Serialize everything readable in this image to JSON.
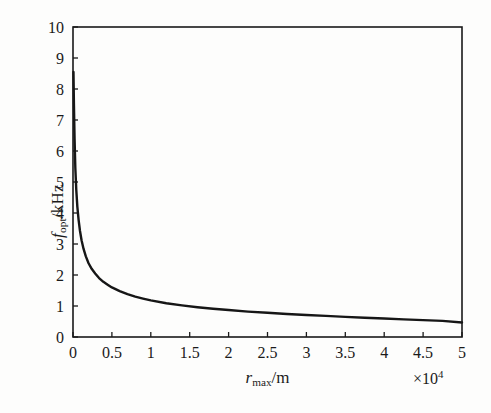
{
  "figure": {
    "background_color": "#fdfdfc",
    "frame_color": "#1a1a1a",
    "curve_color": "#161616"
  },
  "axis_labels": {
    "y_symbol": "f",
    "y_subscript": "opt",
    "y_unit": "/kHz",
    "x_symbol": "r",
    "x_subscript": "max",
    "x_unit": "/m",
    "x_multiplier_times": "×",
    "x_multiplier_base": "10",
    "x_multiplier_exponent": "4"
  },
  "chart_data": {
    "type": "line",
    "title": "",
    "xlabel": "r_max/m",
    "ylabel": "f_opt/kHz",
    "x_multiplier": "×10^4",
    "xlim": [
      0,
      50000
    ],
    "ylim": [
      0,
      10
    ],
    "xticks": [
      0,
      5000,
      10000,
      15000,
      20000,
      25000,
      30000,
      35000,
      40000,
      45000,
      50000
    ],
    "xticklabels": [
      "0",
      "0.5",
      "1",
      "1.5",
      "2",
      "2.5",
      "3",
      "3.5",
      "4",
      "4.5",
      "5"
    ],
    "yticks": [
      0,
      1,
      2,
      3,
      4,
      5,
      6,
      7,
      8,
      9,
      10
    ],
    "yticklabels": [
      "0",
      "1",
      "2",
      "3",
      "4",
      "5",
      "6",
      "7",
      "8",
      "9",
      "10"
    ],
    "grid": false,
    "legend": null,
    "tick_direction": "in",
    "series": [
      {
        "name": "f_opt vs r_max",
        "x": [
          60,
          120,
          200,
          300,
          420,
          560,
          720,
          900,
          1100,
          1350,
          1650,
          2000,
          2400,
          2850,
          3350,
          3900,
          4500,
          5000,
          6000,
          7000,
          8000,
          9000,
          10000,
          12000,
          14000,
          16000,
          18000,
          20000,
          22500,
          25000,
          27500,
          30000,
          32500,
          35000,
          37500,
          40000,
          42500,
          45000,
          47500,
          50000
        ],
        "y": [
          8.55,
          7.5,
          6.4,
          5.45,
          4.75,
          4.2,
          3.78,
          3.42,
          3.12,
          2.85,
          2.6,
          2.38,
          2.2,
          2.05,
          1.9,
          1.78,
          1.68,
          1.6,
          1.48,
          1.38,
          1.3,
          1.24,
          1.18,
          1.09,
          1.02,
          0.96,
          0.91,
          0.87,
          0.82,
          0.78,
          0.74,
          0.71,
          0.68,
          0.65,
          0.62,
          0.595,
          0.57,
          0.545,
          0.52,
          0.47
        ]
      }
    ]
  }
}
